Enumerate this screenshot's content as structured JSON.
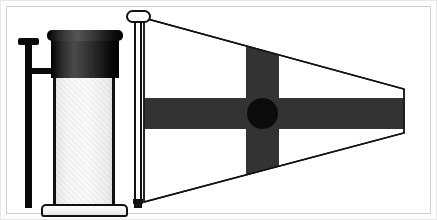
{
  "image": {
    "title": "Jar and signal pennant illustration",
    "background_color": "#ffffff",
    "frame_color": "#cfcfcf",
    "width": 437,
    "height": 220
  },
  "jar": {
    "name": "glass jar with dark lid",
    "cap_color": "#1a1a1a",
    "glass_color": "#f4f4f4",
    "outline_color": "#111111",
    "base_color": "#f2f2f2",
    "side_post_color": "#0a0a0a"
  },
  "flag": {
    "name": "tapering signal pennant",
    "pole_color": "#111111",
    "field_color": "#ffffff",
    "cross_color": "#333333",
    "disc_color": "#0b0b0b",
    "outline_color": "#111111",
    "shape": "pennant-truncated-triangle",
    "pennant_path": "M 2 2 L 260 72 L 260 116 L 2 184 Z",
    "vertical_bar": {
      "x": 104,
      "width": 33,
      "y": 0,
      "height": 188
    },
    "horizontal_bar": {
      "x": 0,
      "y": 82,
      "width": 262,
      "height": 31
    }
  }
}
